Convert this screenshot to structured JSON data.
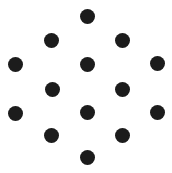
{
  "canvas": {
    "width": 172,
    "height": 173,
    "background_color": "#ffffff",
    "title": "Dot Pattern"
  },
  "figure": {
    "name": "hexagonal-dot-lattice",
    "dot_count": 14,
    "dot_color": "#1c1c1c",
    "dot_diameter": 15,
    "dot_radius": 7.5
  },
  "chart_data": {
    "type": "scatter",
    "title": "",
    "xlabel": "",
    "ylabel": "",
    "xlim": [
      0,
      172
    ],
    "ylim": [
      0,
      173
    ],
    "grid": false,
    "legend": null,
    "marker": "circle",
    "marker_color": "#1c1c1c",
    "marker_diameter": 15,
    "points": [
      {
        "id": "dot-1",
        "row": 1,
        "x": 87,
        "y": 16
      },
      {
        "id": "dot-2",
        "row": 2,
        "x": 51,
        "y": 40
      },
      {
        "id": "dot-3",
        "row": 2,
        "x": 122,
        "y": 40
      },
      {
        "id": "dot-4",
        "row": 3,
        "x": 15,
        "y": 64
      },
      {
        "id": "dot-5",
        "row": 3,
        "x": 87,
        "y": 64
      },
      {
        "id": "dot-6",
        "row": 3,
        "x": 157,
        "y": 63
      },
      {
        "id": "dot-7",
        "row": 4,
        "x": 52,
        "y": 89
      },
      {
        "id": "dot-8",
        "row": 4,
        "x": 122,
        "y": 89
      },
      {
        "id": "dot-9",
        "row": 5,
        "x": 15,
        "y": 113
      },
      {
        "id": "dot-10",
        "row": 5,
        "x": 87,
        "y": 112
      },
      {
        "id": "dot-11",
        "row": 5,
        "x": 157,
        "y": 112
      },
      {
        "id": "dot-12",
        "row": 6,
        "x": 51,
        "y": 135
      },
      {
        "id": "dot-13",
        "row": 6,
        "x": 122,
        "y": 135
      },
      {
        "id": "dot-14",
        "row": 7,
        "x": 87,
        "y": 157
      }
    ]
  }
}
